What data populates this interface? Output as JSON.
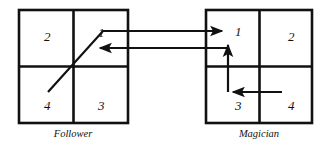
{
  "figure": {
    "background_color": "#ffffff",
    "stroke_color": "#111111",
    "text_color": "#111111"
  },
  "groups": [
    {
      "id": "follower",
      "label": "Follower",
      "box": {
        "x": 19,
        "y": 10,
        "w": 109,
        "h": 113
      },
      "cells": [
        {
          "id": "follower-cell-2",
          "value": "2",
          "quadrant": "top-left",
          "tx": 44,
          "ty": 41
        },
        {
          "id": "follower-cell-1",
          "value": "1",
          "quadrant": "top-right",
          "tx": 98,
          "ty": 37
        },
        {
          "id": "follower-cell-4",
          "value": "4",
          "quadrant": "bottom-left",
          "tx": 44,
          "ty": 110
        },
        {
          "id": "follower-cell-3",
          "value": "3",
          "quadrant": "bottom-right",
          "tx": 98,
          "ty": 110
        }
      ]
    },
    {
      "id": "magician",
      "label": "Magician",
      "box": {
        "x": 206,
        "y": 10,
        "w": 106,
        "h": 113
      },
      "cells": [
        {
          "id": "magician-cell-1",
          "value": "1",
          "quadrant": "top-left",
          "tx": 235,
          "ty": 36
        },
        {
          "id": "magician-cell-2",
          "value": "2",
          "quadrant": "top-right",
          "tx": 288,
          "ty": 41
        },
        {
          "id": "magician-cell-3",
          "value": "3",
          "quadrant": "bottom-left",
          "tx": 235,
          "ty": 110
        },
        {
          "id": "magician-cell-4",
          "value": "4",
          "quadrant": "bottom-right",
          "tx": 288,
          "ty": 110
        }
      ]
    }
  ],
  "labels": [
    {
      "id": "follower-label",
      "text": "Follower",
      "x": 73,
      "y": 137
    },
    {
      "id": "magician-label",
      "text": "Magician",
      "x": 259,
      "y": 137
    }
  ],
  "connectors": [
    {
      "id": "follower-diagonal-to-magician-1",
      "description": "diagonal from Follower quadrant 4 through center up to quadrant 1, then horizontal right into Magician quadrant 1",
      "points": "48,92 103,31 222,31",
      "arrowhead": "end"
    },
    {
      "id": "magician-to-follower-return",
      "description": "horizontal arrow from Magician quadrant 1 leftwards back into Follower quadrant 1",
      "points": "228,48 100,48",
      "arrowhead": "end"
    },
    {
      "id": "magician-3-to-1",
      "description": "vertical arrow inside Magician from quadrant 3 up into quadrant 1",
      "points": "228,92 228,45",
      "arrowhead": "end"
    },
    {
      "id": "magician-4-to-3",
      "description": "horizontal arrow inside Magician from quadrant 4 left into quadrant 3",
      "points": "282,92 233,92",
      "arrowhead": "end"
    }
  ]
}
